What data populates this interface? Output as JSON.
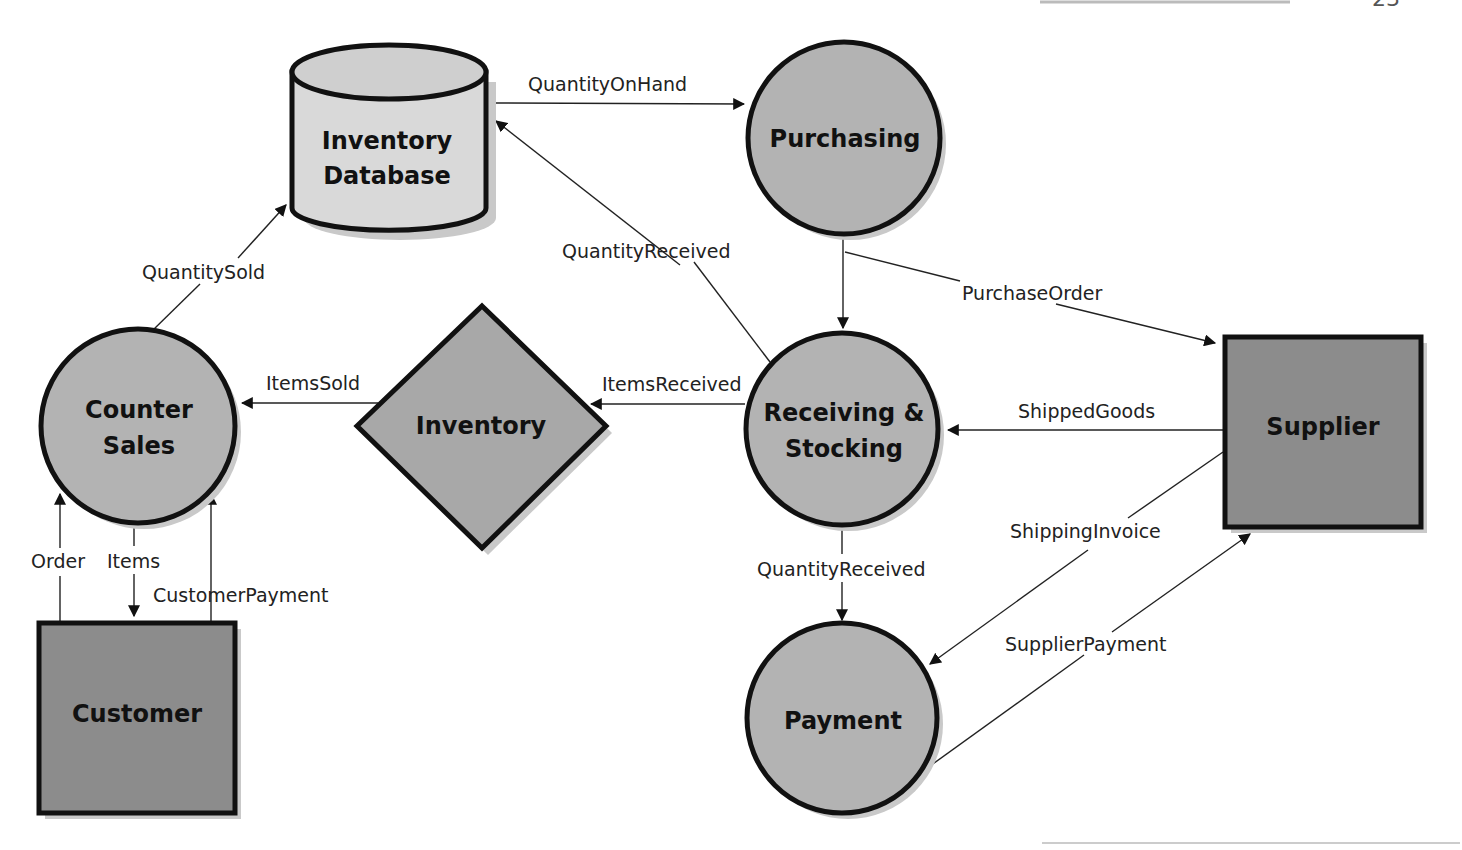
{
  "colors": {
    "process_fill": "#b3b3b3",
    "entity_fill": "#8c8c8c",
    "store_fill": "#d9d9d9",
    "stroke": "#111111",
    "shadow": "#c9c9c9"
  },
  "nodes": {
    "inventory_database": {
      "type": "data-store",
      "lines": [
        "Inventory",
        "Database"
      ]
    },
    "purchasing": {
      "type": "process",
      "lines": [
        "Purchasing"
      ]
    },
    "counter_sales": {
      "type": "process",
      "lines": [
        "Counter",
        "Sales"
      ]
    },
    "inventory": {
      "type": "decision",
      "lines": [
        "Inventory"
      ]
    },
    "receiving_stocking": {
      "type": "process",
      "lines": [
        "Receiving &",
        "Stocking"
      ]
    },
    "supplier": {
      "type": "external-entity",
      "lines": [
        "Supplier"
      ]
    },
    "customer": {
      "type": "external-entity",
      "lines": [
        "Customer"
      ]
    },
    "payment": {
      "type": "process",
      "lines": [
        "Payment"
      ]
    }
  },
  "flows": {
    "quantity_on_hand": {
      "label": "QuantityOnHand",
      "from": "Inventory Database",
      "to": "Purchasing"
    },
    "quantity_received_db": {
      "label": "QuantityReceived",
      "from": "Receiving & Stocking",
      "to": "Inventory Database"
    },
    "quantity_sold": {
      "label": "QuantitySold",
      "from": "Counter Sales",
      "to": "Inventory Database"
    },
    "purchase_order": {
      "label": "PurchaseOrder",
      "from": "Purchasing",
      "to": "Supplier"
    },
    "items_sold": {
      "label": "ItemsSold",
      "from": "Inventory",
      "to": "Counter Sales"
    },
    "items_received": {
      "label": "ItemsReceived",
      "from": "Receiving & Stocking",
      "to": "Inventory"
    },
    "shipped_goods": {
      "label": "ShippedGoods",
      "from": "Supplier",
      "to": "Receiving & Stocking"
    },
    "shipping_invoice": {
      "label": "ShippingInvoice",
      "from": "Supplier",
      "to": "Payment"
    },
    "quantity_received_pay": {
      "label": "QuantityReceived",
      "from": "Receiving & Stocking",
      "to": "Payment"
    },
    "supplier_payment": {
      "label": "SupplierPayment",
      "from": "Payment",
      "to": "Supplier"
    },
    "order": {
      "label": "Order",
      "from": "Customer",
      "to": "Counter Sales"
    },
    "items": {
      "label": "Items",
      "from": "Counter Sales",
      "to": "Customer"
    },
    "customer_payment": {
      "label": "CustomerPayment",
      "from": "Customer",
      "to": "Counter Sales"
    }
  },
  "page": {
    "number_partial": "23"
  }
}
